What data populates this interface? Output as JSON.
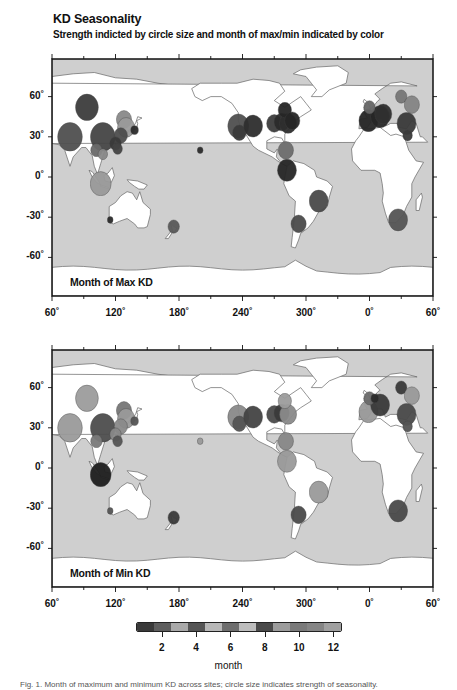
{
  "header": {
    "title": "KD Seasonality",
    "subtitle": "Strength indicted by circle size and month of max/min indicated by color"
  },
  "axes": {
    "x_ticks": [
      "60˚",
      "120˚",
      "180˚",
      "240˚",
      "300˚",
      "0˚",
      "60˚"
    ],
    "y_ticks": [
      "60˚",
      "30˚",
      "0˚",
      "-30˚",
      "-60˚"
    ]
  },
  "panels": [
    {
      "label": "Month of Max KD"
    },
    {
      "label": "Month of Min KD"
    }
  ],
  "colorbar": {
    "title": "month",
    "tick_labels": [
      "2",
      "4",
      "6",
      "8",
      "10",
      "12"
    ],
    "segments": [
      "#3a3a3a",
      "#5e5e5e",
      "#a9a9a9",
      "#555555",
      "#b8b8b8",
      "#6e6e6e",
      "#bdbdbd",
      "#4a4a4a",
      "#9c9c9c",
      "#7a7a7a",
      "#858585",
      "#a0a0a0"
    ]
  },
  "caption": "Fig. 1. Month of maximum and minimum KD across sites; circle size indicates strength of seasonality.",
  "chart_data": [
    {
      "type": "scatter",
      "title": "Month of Max KD",
      "xlabel": "Longitude",
      "ylabel": "Latitude",
      "x_range": [
        60,
        420
      ],
      "y_range": [
        -90,
        90
      ],
      "x_ticks": [
        60,
        120,
        180,
        240,
        300,
        360,
        420
      ],
      "y_ticks": [
        60,
        30,
        0,
        -30,
        -60
      ],
      "points": [
        {
          "lon": 93,
          "lat": 52,
          "size": 12,
          "color": "#3d3d3d"
        },
        {
          "lon": 77,
          "lat": 30,
          "size": 13,
          "color": "#505050"
        },
        {
          "lon": 108,
          "lat": 30,
          "size": 13,
          "color": "#454545"
        },
        {
          "lon": 128,
          "lat": 43,
          "size": 8,
          "color": "#8a8a8a"
        },
        {
          "lon": 130,
          "lat": 37,
          "size": 9,
          "color": "#9a9a9a"
        },
        {
          "lon": 125,
          "lat": 31,
          "size": 7,
          "color": "#4d4d4d"
        },
        {
          "lon": 120,
          "lat": 25,
          "size": 6,
          "color": "#3a3a3a"
        },
        {
          "lon": 122,
          "lat": 21,
          "size": 5,
          "color": "#444"
        },
        {
          "lon": 102,
          "lat": 20,
          "size": 6,
          "color": "#6a6a6a"
        },
        {
          "lon": 138,
          "lat": 35,
          "size": 4,
          "color": "#2b2b2b"
        },
        {
          "lon": 108,
          "lat": 17,
          "size": 5,
          "color": "#888"
        },
        {
          "lon": 106,
          "lat": -5,
          "size": 11,
          "color": "#9a9a9a"
        },
        {
          "lon": 200,
          "lat": 20,
          "size": 3,
          "color": "#2b2b2b"
        },
        {
          "lon": 115,
          "lat": -32,
          "size": 3,
          "color": "#2b2b2b"
        },
        {
          "lon": 175,
          "lat": -37,
          "size": 6,
          "color": "#5a5a5a"
        },
        {
          "lon": 236,
          "lat": 38,
          "size": 11,
          "color": "#505050"
        },
        {
          "lon": 237,
          "lat": 33,
          "size": 7,
          "color": "#3a3a3a"
        },
        {
          "lon": 250,
          "lat": 38,
          "size": 10,
          "color": "#2e2e2e"
        },
        {
          "lon": 270,
          "lat": 40,
          "size": 8,
          "color": "#3d3d3d"
        },
        {
          "lon": 277,
          "lat": 41,
          "size": 8,
          "color": "#2b2b2b"
        },
        {
          "lon": 283,
          "lat": 40,
          "size": 9,
          "color": "#2e2e2e"
        },
        {
          "lon": 280,
          "lat": 50,
          "size": 7,
          "color": "#262626"
        },
        {
          "lon": 287,
          "lat": 42,
          "size": 8,
          "color": "#262626"
        },
        {
          "lon": 281,
          "lat": 20,
          "size": 8,
          "color": "#6e6e6e"
        },
        {
          "lon": 282,
          "lat": 5,
          "size": 10,
          "color": "#262626"
        },
        {
          "lon": 312,
          "lat": -18,
          "size": 10,
          "color": "#4a4a4a"
        },
        {
          "lon": 293,
          "lat": -35,
          "size": 8,
          "color": "#4a4a4a"
        },
        {
          "lon": 359,
          "lat": 42,
          "size": 10,
          "color": "#262626"
        },
        {
          "lon": 10,
          "lat": 45,
          "size": 10,
          "color": "#262626"
        },
        {
          "lon": 13,
          "lat": 47,
          "size": 9,
          "color": "#303030"
        },
        {
          "lon": 0,
          "lat": 52,
          "size": 6,
          "color": "#666"
        },
        {
          "lon": 30,
          "lat": 60,
          "size": 6,
          "color": "#777"
        },
        {
          "lon": 40,
          "lat": 54,
          "size": 8,
          "color": "#858585"
        },
        {
          "lon": 35,
          "lat": 40,
          "size": 10,
          "color": "#3a3a3a"
        },
        {
          "lon": 36,
          "lat": 31,
          "size": 5,
          "color": "#3a3a3a"
        },
        {
          "lon": 27,
          "lat": -32,
          "size": 10,
          "color": "#555555"
        }
      ]
    },
    {
      "type": "scatter",
      "title": "Month of Min KD",
      "xlabel": "Longitude",
      "ylabel": "Latitude",
      "x_range": [
        60,
        420
      ],
      "y_range": [
        -90,
        90
      ],
      "x_ticks": [
        60,
        120,
        180,
        240,
        300,
        360,
        420
      ],
      "y_ticks": [
        60,
        30,
        0,
        -30,
        -60
      ],
      "points": [
        {
          "lon": 93,
          "lat": 52,
          "size": 12,
          "color": "#9c9c9c"
        },
        {
          "lon": 77,
          "lat": 30,
          "size": 13,
          "color": "#9a9a9a"
        },
        {
          "lon": 108,
          "lat": 30,
          "size": 13,
          "color": "#4d4d4d"
        },
        {
          "lon": 128,
          "lat": 43,
          "size": 8,
          "color": "#777"
        },
        {
          "lon": 130,
          "lat": 37,
          "size": 9,
          "color": "#9a9a9a"
        },
        {
          "lon": 125,
          "lat": 31,
          "size": 7,
          "color": "#8a8a8a"
        },
        {
          "lon": 120,
          "lat": 25,
          "size": 6,
          "color": "#888"
        },
        {
          "lon": 122,
          "lat": 20,
          "size": 5,
          "color": "#555"
        },
        {
          "lon": 102,
          "lat": 20,
          "size": 6,
          "color": "#7a7a7a"
        },
        {
          "lon": 138,
          "lat": 35,
          "size": 4,
          "color": "#555"
        },
        {
          "lon": 106,
          "lat": -5,
          "size": 11,
          "color": "#1f1f1f"
        },
        {
          "lon": 200,
          "lat": 20,
          "size": 3,
          "color": "#9a9a9a"
        },
        {
          "lon": 115,
          "lat": -32,
          "size": 3,
          "color": "#555"
        },
        {
          "lon": 175,
          "lat": -37,
          "size": 6,
          "color": "#3a3a3a"
        },
        {
          "lon": 236,
          "lat": 38,
          "size": 11,
          "color": "#8a8a8a"
        },
        {
          "lon": 237,
          "lat": 33,
          "size": 7,
          "color": "#555"
        },
        {
          "lon": 250,
          "lat": 38,
          "size": 10,
          "color": "#444"
        },
        {
          "lon": 270,
          "lat": 40,
          "size": 8,
          "color": "#4a4a4a"
        },
        {
          "lon": 277,
          "lat": 41,
          "size": 8,
          "color": "#3a3a3a"
        },
        {
          "lon": 283,
          "lat": 40,
          "size": 9,
          "color": "#8a8a8a"
        },
        {
          "lon": 280,
          "lat": 50,
          "size": 7,
          "color": "#9c9c9c"
        },
        {
          "lon": 281,
          "lat": 20,
          "size": 8,
          "color": "#888"
        },
        {
          "lon": 282,
          "lat": 5,
          "size": 10,
          "color": "#9a9a9a"
        },
        {
          "lon": 312,
          "lat": -18,
          "size": 10,
          "color": "#9a9a9a"
        },
        {
          "lon": 293,
          "lat": -35,
          "size": 8,
          "color": "#4a4a4a"
        },
        {
          "lon": 359,
          "lat": 42,
          "size": 10,
          "color": "#9a9a9a"
        },
        {
          "lon": 10,
          "lat": 47,
          "size": 10,
          "color": "#3a3a3a"
        },
        {
          "lon": 0,
          "lat": 52,
          "size": 6,
          "color": "#6a6a6a"
        },
        {
          "lon": 5,
          "lat": 52,
          "size": 4,
          "color": "#2b2b2b"
        },
        {
          "lon": 30,
          "lat": 60,
          "size": 6,
          "color": "#3a3a3a"
        },
        {
          "lon": 40,
          "lat": 54,
          "size": 8,
          "color": "#9a9a9a"
        },
        {
          "lon": 35,
          "lat": 40,
          "size": 10,
          "color": "#4a4a4a"
        },
        {
          "lon": 36,
          "lat": 31,
          "size": 5,
          "color": "#555"
        },
        {
          "lon": 27,
          "lat": -32,
          "size": 10,
          "color": "#4a4a4a"
        }
      ]
    }
  ]
}
